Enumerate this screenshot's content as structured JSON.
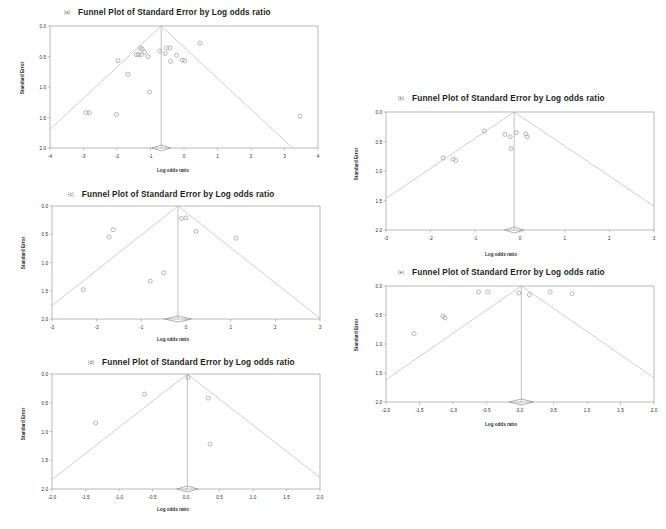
{
  "figure": {
    "background": "#ffffff",
    "point_color": "#9d9d9d",
    "line_color": "#b9b9b9",
    "frame_color": "#9a9a9a"
  },
  "panels": [
    {
      "tag": "(a)",
      "title": "Funnel Plot of Standard Error by Log odds ratio",
      "xlabel": "Log odds ratio",
      "ylabel": "Standard Error",
      "xticks": [
        "-4",
        "-3",
        "-2",
        "-1",
        "0",
        "1",
        "2",
        "3",
        "4"
      ],
      "yticks": [
        "0.0",
        "0.5",
        "1.0",
        "1.5",
        "2.0"
      ]
    },
    {
      "tag": "(b)",
      "title": "Funnel Plot of Standard Error by Log odds ratio",
      "xlabel": "Log odds ratio",
      "ylabel": "Standard Error",
      "xticks": [
        "-3",
        "-2",
        "-1",
        "0",
        "1",
        "2",
        "3"
      ],
      "yticks": [
        "0.0",
        "0.5",
        "1.0",
        "1.5",
        "2.0"
      ]
    },
    {
      "tag": "(c)",
      "title": "Funnel Plot of Standard Error by Log odds ratio",
      "xlabel": "Log odds ratio",
      "ylabel": "Standard Error",
      "xticks": [
        "-3",
        "-2",
        "-1",
        "0",
        "1",
        "2",
        "3"
      ],
      "yticks": [
        "0.0",
        "0.5",
        "1.0",
        "1.5",
        "2.0"
      ]
    },
    {
      "tag": "(d)",
      "title": "Funnel Plot of Standard Error by Log odds ratio",
      "xlabel": "Log odds ratio",
      "ylabel": "Standard Error",
      "xticks": [
        "-2.0",
        "-1.5",
        "-1.0",
        "-0.5",
        "0.0",
        "0.5",
        "1.0",
        "1.5",
        "2.0"
      ],
      "yticks": [
        "0.0",
        "0.5",
        "1.0",
        "1.5",
        "2.0"
      ]
    },
    {
      "tag": "(e)",
      "title": "Funnel Plot of Standard Error by Log odds ratio",
      "xlabel": "Log odds ratio",
      "ylabel": "Standard Error",
      "xticks": [
        "-2.0",
        "-1.5",
        "-1.0",
        "-0.5",
        "0.0",
        "0.5",
        "1.0",
        "1.5",
        "2.0"
      ],
      "yticks": [
        "0.0",
        "0.5",
        "1.0",
        "1.5",
        "2.0"
      ]
    }
  ],
  "chart_data": [
    {
      "type": "scatter",
      "id": "panel-a",
      "title": "Funnel Plot of Standard Error by Log odds ratio",
      "xlabel": "Log odds ratio",
      "ylabel": "Standard Error",
      "xlim": [
        -4,
        4
      ],
      "ylim": [
        2.0,
        0.0
      ],
      "y_inverted": true,
      "grid": false,
      "legend": "none",
      "apex": [
        -0.68,
        0.0
      ],
      "funnel_slope_x_per_y": 1.96,
      "summary_diamond": {
        "x": -0.68,
        "y": 2.0,
        "half_width": 0.28
      },
      "points": [
        {
          "x": -1.3,
          "y": 0.36
        },
        {
          "x": -1.25,
          "y": 0.38
        },
        {
          "x": -1.42,
          "y": 0.47
        },
        {
          "x": -1.36,
          "y": 0.47
        },
        {
          "x": -1.28,
          "y": 0.47
        },
        {
          "x": -1.18,
          "y": 0.43
        },
        {
          "x": -1.08,
          "y": 0.5
        },
        {
          "x": -0.72,
          "y": 0.41
        },
        {
          "x": -0.52,
          "y": 0.36
        },
        {
          "x": -0.56,
          "y": 0.45
        },
        {
          "x": -0.42,
          "y": 0.36
        },
        {
          "x": -0.4,
          "y": 0.58
        },
        {
          "x": -0.22,
          "y": 0.48
        },
        {
          "x": -0.05,
          "y": 0.56
        },
        {
          "x": 0.02,
          "y": 0.57
        },
        {
          "x": 0.48,
          "y": 0.28
        },
        {
          "x": -1.97,
          "y": 0.57
        },
        {
          "x": -1.68,
          "y": 0.79
        },
        {
          "x": -1.03,
          "y": 1.08
        },
        {
          "x": -2.02,
          "y": 1.45
        },
        {
          "x": -2.92,
          "y": 1.42
        },
        {
          "x": -2.83,
          "y": 1.42
        },
        {
          "x": 3.46,
          "y": 1.48
        }
      ]
    },
    {
      "type": "scatter",
      "id": "panel-b",
      "title": "Funnel Plot of Standard Error by Log odds ratio",
      "xlabel": "Log odds ratio",
      "ylabel": "Standard Error",
      "xlim": [
        -3,
        3
      ],
      "ylim": [
        2.0,
        0.0
      ],
      "y_inverted": true,
      "grid": false,
      "legend": "none",
      "apex": [
        -0.13,
        0.0
      ],
      "funnel_slope_x_per_y": 1.96,
      "summary_diamond": {
        "x": -0.13,
        "y": 2.0,
        "half_width": 0.22
      },
      "points": [
        {
          "x": -0.8,
          "y": 0.32
        },
        {
          "x": -0.22,
          "y": 0.42
        },
        {
          "x": -0.34,
          "y": 0.38
        },
        {
          "x": -0.08,
          "y": 0.35
        },
        {
          "x": 0.13,
          "y": 0.37
        },
        {
          "x": 0.16,
          "y": 0.42
        },
        {
          "x": -0.2,
          "y": 0.62
        },
        {
          "x": -1.72,
          "y": 0.78
        },
        {
          "x": -1.5,
          "y": 0.8
        },
        {
          "x": -1.44,
          "y": 0.82
        }
      ]
    },
    {
      "type": "scatter",
      "id": "panel-c",
      "title": "Funnel Plot of Standard Error by Log odds ratio",
      "xlabel": "Log odds ratio",
      "ylabel": "Standard Error",
      "xlim": [
        -3,
        3
      ],
      "ylim": [
        2.0,
        0.0
      ],
      "y_inverted": true,
      "grid": false,
      "legend": "none",
      "apex": [
        -0.18,
        0.0
      ],
      "funnel_slope_x_per_y": 1.6,
      "summary_diamond": {
        "x": -0.18,
        "y": 2.0,
        "half_width": 0.3
      },
      "points": [
        {
          "x": -0.1,
          "y": 0.22
        },
        {
          "x": 0.0,
          "y": 0.21
        },
        {
          "x": -1.63,
          "y": 0.42
        },
        {
          "x": -1.72,
          "y": 0.55
        },
        {
          "x": 0.22,
          "y": 0.45
        },
        {
          "x": 1.12,
          "y": 0.57
        },
        {
          "x": -0.5,
          "y": 1.18
        },
        {
          "x": -0.8,
          "y": 1.33
        },
        {
          "x": -2.3,
          "y": 1.48
        }
      ]
    },
    {
      "type": "scatter",
      "id": "panel-d",
      "title": "Funnel Plot of Standard Error by Log odds ratio",
      "xlabel": "Log odds ratio",
      "ylabel": "Standard Error",
      "xlim": [
        -2.0,
        2.0
      ],
      "ylim": [
        2.0,
        0.0
      ],
      "y_inverted": true,
      "grid": false,
      "legend": "none",
      "apex": [
        0.02,
        0.0
      ],
      "funnel_slope_x_per_y": 1.1,
      "summary_diamond": {
        "x": 0.02,
        "y": 2.0,
        "half_width": 0.16
      },
      "points": [
        {
          "x": 0.03,
          "y": 0.06
        },
        {
          "x": -0.62,
          "y": 0.35
        },
        {
          "x": 0.33,
          "y": 0.42
        },
        {
          "x": -1.35,
          "y": 0.85
        },
        {
          "x": 0.36,
          "y": 1.22
        }
      ]
    },
    {
      "type": "scatter",
      "id": "panel-e",
      "title": "Funnel Plot of Standard Error by Log odds ratio",
      "xlabel": "Log odds ratio",
      "ylabel": "Standard Error",
      "xlim": [
        -2.0,
        2.0
      ],
      "ylim": [
        2.0,
        0.0
      ],
      "y_inverted": true,
      "grid": false,
      "legend": "none",
      "apex": [
        0.02,
        0.0
      ],
      "funnel_slope_x_per_y": 1.25,
      "summary_diamond": {
        "x": 0.02,
        "y": 2.0,
        "half_width": 0.18
      },
      "points": [
        {
          "x": -0.02,
          "y": 0.12
        },
        {
          "x": 0.14,
          "y": 0.15
        },
        {
          "x": -0.62,
          "y": 0.1
        },
        {
          "x": -0.48,
          "y": 0.1
        },
        {
          "x": 0.45,
          "y": 0.1
        },
        {
          "x": 0.78,
          "y": 0.13
        },
        {
          "x": -1.15,
          "y": 0.52
        },
        {
          "x": -1.12,
          "y": 0.55
        },
        {
          "x": -1.58,
          "y": 0.82
        }
      ]
    }
  ]
}
